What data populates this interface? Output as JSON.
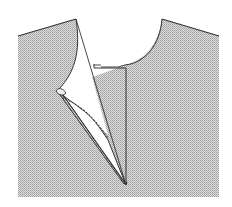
{
  "diagram": {
    "type": "sewing-illustration",
    "colors": {
      "fabric": "#d4d4d4",
      "fabric_dots": "#a8a8a8",
      "outline": "#333333",
      "background": "#ffffff"
    },
    "parts": [
      {
        "name": "bodice-left"
      },
      {
        "name": "bodice-right"
      },
      {
        "name": "neckline-opening"
      },
      {
        "name": "placket-strip"
      },
      {
        "name": "folded-flap"
      },
      {
        "name": "slit-point"
      },
      {
        "name": "stitch-line"
      }
    ]
  }
}
